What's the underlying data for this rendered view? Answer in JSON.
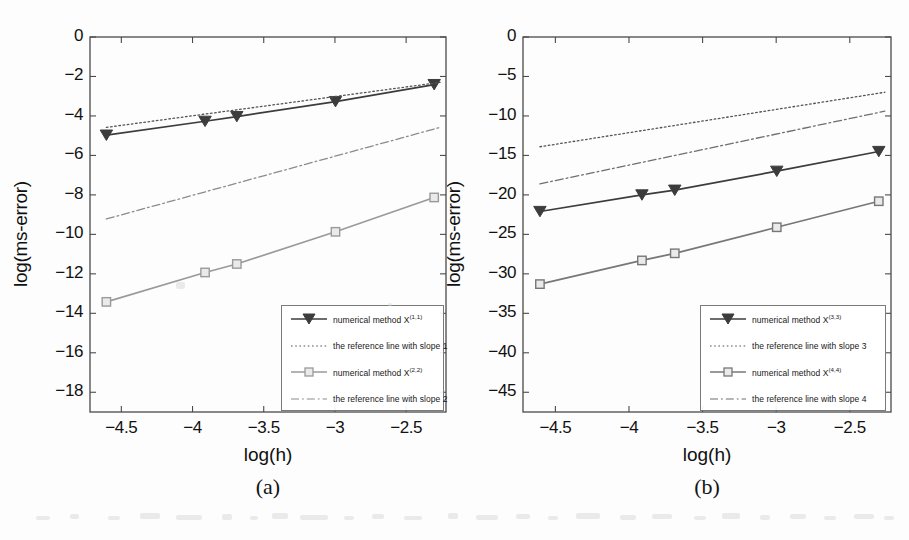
{
  "figure": {
    "background_color": "#fdfdfd",
    "axis_color": "#4a4a4a",
    "text_color": "#111111"
  },
  "panels": [
    {
      "id": "a",
      "caption": "(a)",
      "chart_data": {
        "type": "line",
        "title": "",
        "xlabel": "log(h)",
        "ylabel": "log(ms-error)",
        "xlim": [
          -4.72,
          -2.22
        ],
        "ylim": [
          -19.0,
          0.0
        ],
        "xticks": [
          -4.5,
          -4,
          -3.5,
          -3,
          -2.5
        ],
        "xticklabels": [
          "-4.5",
          "-4",
          "-3.5",
          "-3",
          "-2.5"
        ],
        "yticks": [
          0,
          -2,
          -4,
          -6,
          -8,
          -10,
          -12,
          -14,
          -16,
          -18
        ],
        "yticklabels": [
          "0",
          "-2",
          "-4",
          "-6",
          "-8",
          "-10",
          "-12",
          "-14",
          "-16",
          "-18"
        ],
        "grid": false,
        "legend_position": "lower right",
        "series": [
          {
            "name": "numerical method X",
            "name_sup": "(1,1)",
            "legend_label": "numerical method X(1,1)",
            "style": "solid",
            "marker": "triangle-down",
            "color": "#3c3c3c",
            "x": [
              -4.605,
              -3.912,
              -3.689,
              -2.996,
              -2.303
            ],
            "y": [
              -4.97,
              -4.27,
              -4.03,
              -3.27,
              -2.41
            ]
          },
          {
            "name": "the reference line with slope 1",
            "legend_label": "the reference line with slope 1",
            "style": "dotted",
            "marker": "none",
            "color": "#555555",
            "x": [
              -4.605,
              -2.262
            ],
            "y": [
              -4.58,
              -2.3
            ]
          },
          {
            "name": "numerical method X",
            "name_sup": "(2,2)",
            "legend_label": "numerical method X(2,2)",
            "style": "solid",
            "marker": "square",
            "color": "#9a9a9a",
            "x": [
              -4.605,
              -3.912,
              -3.689,
              -2.996,
              -2.303
            ],
            "y": [
              -13.42,
              -11.93,
              -11.5,
              -9.87,
              -8.13
            ]
          },
          {
            "name": "the reference line with slope 2",
            "legend_label": "the reference line with slope 2",
            "style": "dashdot",
            "marker": "none",
            "color": "#8c8c8c",
            "x": [
              -4.605,
              -2.262
            ],
            "y": [
              -9.22,
              -4.58
            ]
          }
        ],
        "legend_entries": [
          {
            "label_prefix": "numerical method X",
            "label_sup": "(1,1)",
            "style": "solid",
            "marker": "triangle-down",
            "color": "#3c3c3c"
          },
          {
            "label_prefix": "the reference line with slope 1",
            "label_sup": "",
            "style": "dotted",
            "marker": "none",
            "color": "#555555"
          },
          {
            "label_prefix": "numerical method X",
            "label_sup": "(2,2)",
            "style": "solid",
            "marker": "square",
            "color": "#9a9a9a"
          },
          {
            "label_prefix": "the reference line with slope 2",
            "label_sup": "",
            "style": "dashdot",
            "marker": "none",
            "color": "#8c8c8c"
          }
        ]
      }
    },
    {
      "id": "b",
      "caption": "(b)",
      "chart_data": {
        "type": "line",
        "title": "",
        "xlabel": "log(h)",
        "ylabel": "log(ms-error)",
        "xlim": [
          -4.72,
          -2.22
        ],
        "ylim": [
          -47.5,
          0.0
        ],
        "xticks": [
          -4.5,
          -4,
          -3.5,
          -3,
          -2.5
        ],
        "xticklabels": [
          "-4.5",
          "-4",
          "-3.5",
          "-3",
          "-2.5"
        ],
        "yticks": [
          0,
          -5,
          -10,
          -15,
          -20,
          -25,
          -30,
          -35,
          -40,
          -45
        ],
        "yticklabels": [
          "0",
          "-5",
          "-10",
          "-15",
          "-20",
          "-25",
          "-30",
          "-35",
          "-40",
          "-45"
        ],
        "grid": false,
        "legend_position": "lower right",
        "series": [
          {
            "name": "numerical method X",
            "name_sup": "(3,3)",
            "legend_label": "numerical method X(3,3)",
            "style": "solid",
            "marker": "triangle-down",
            "color": "#3c3c3c",
            "x": [
              -4.605,
              -3.912,
              -3.689,
              -2.996,
              -2.303
            ],
            "y": [
              -22.1,
              -20.0,
              -19.4,
              -17.0,
              -14.5
            ]
          },
          {
            "name": "the reference line with slope 3",
            "legend_label": "the reference line with slope 3",
            "style": "dotted",
            "marker": "none",
            "color": "#555555",
            "x": [
              -4.605,
              -2.262
            ],
            "y": [
              -13.9,
              -7.0
            ]
          },
          {
            "name": "numerical method X",
            "name_sup": "(4,4)",
            "legend_label": "numerical method X(4,4)",
            "style": "solid",
            "marker": "square",
            "color": "#777777",
            "x": [
              -4.605,
              -3.912,
              -3.689,
              -2.996,
              -2.303
            ],
            "y": [
              -31.3,
              -28.3,
              -27.4,
              -24.1,
              -20.8
            ]
          },
          {
            "name": "the reference line with slope 4",
            "legend_label": "the reference line with slope 4",
            "style": "dashdot",
            "marker": "none",
            "color": "#6f6f6f",
            "x": [
              -4.605,
              -2.262
            ],
            "y": [
              -18.6,
              -9.4
            ]
          }
        ],
        "legend_entries": [
          {
            "label_prefix": "numerical method X",
            "label_sup": "(3,3)",
            "style": "solid",
            "marker": "triangle-down",
            "color": "#3c3c3c"
          },
          {
            "label_prefix": "the reference line with slope 3",
            "label_sup": "",
            "style": "dotted",
            "marker": "none",
            "color": "#555555"
          },
          {
            "label_prefix": "numerical method X",
            "label_sup": "(4,4)",
            "style": "solid",
            "marker": "square",
            "color": "#777777"
          },
          {
            "label_prefix": "the reference line with slope 4",
            "label_sup": "",
            "style": "dashdot",
            "marker": "none",
            "color": "#6f6f6f"
          }
        ]
      }
    }
  ]
}
